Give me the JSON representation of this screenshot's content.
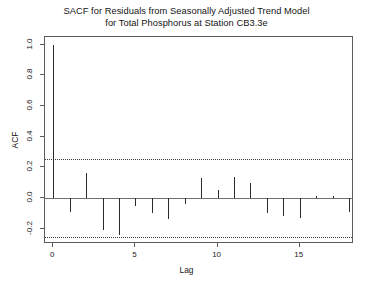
{
  "chart_data": {
    "type": "bar",
    "title": "SACF for Residuals from Seasonally Adjusted Trend Model for Total Phosphorus at Station CB3.3e",
    "title_lines": [
      "SACF for Residuals from Seasonally Adjusted Trend Model",
      "for Total Phosphorus at Station CB3.3e"
    ],
    "xlabel": "Lag",
    "ylabel": "ACF",
    "x": [
      0,
      1,
      2,
      3,
      4,
      5,
      6,
      7,
      8,
      9,
      10,
      11,
      12,
      13,
      14,
      15,
      16,
      17,
      18
    ],
    "values": [
      1.0,
      -0.09,
      0.16,
      -0.21,
      -0.24,
      -0.05,
      -0.1,
      -0.14,
      -0.04,
      0.13,
      0.05,
      0.14,
      0.1,
      -0.1,
      -0.12,
      -0.13,
      0.01,
      0.01,
      -0.09
    ],
    "categories": [
      "0",
      "1",
      "2",
      "3",
      "4",
      "5",
      "6",
      "7",
      "8",
      "9",
      "10",
      "11",
      "12",
      "13",
      "14",
      "15",
      "16",
      "17",
      "18"
    ],
    "series": [
      {
        "name": "ACF",
        "values": [
          1.0,
          -0.09,
          0.16,
          -0.21,
          -0.24,
          -0.05,
          -0.1,
          -0.14,
          -0.04,
          0.13,
          0.05,
          0.14,
          0.1,
          -0.1,
          -0.12,
          -0.13,
          0.01,
          0.01,
          -0.09
        ]
      }
    ],
    "xlim": [
      -0.5,
      18.3
    ],
    "ylim": [
      -0.3,
      1.05
    ],
    "ytick_values": [
      1.0,
      0.8,
      0.6,
      0.4,
      0.2,
      0.0,
      -0.2
    ],
    "ytick_labels": [
      "1.0",
      "0.8",
      "0.6",
      "0.4",
      "0.2",
      "0.0",
      "-0.2"
    ],
    "xtick_values": [
      0,
      5,
      10,
      15
    ],
    "xtick_labels": [
      "0",
      "5",
      "10",
      "15"
    ],
    "confidence_bands": [
      0.2525,
      -0.2525
    ],
    "zero_line": 0.0,
    "grid": false,
    "legend": "none",
    "line_color": "#2b2b2b",
    "conf_color": "#3d3d3d",
    "axis_color": "#5c5c5c"
  }
}
